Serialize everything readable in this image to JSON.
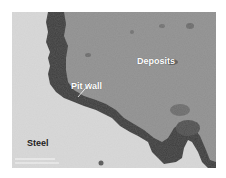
{
  "figure": {
    "type": "micrograph",
    "colors": {
      "steel": "#d9d9d9",
      "deposits": "#8f8f8f",
      "pit_wall_dark": "#3c3c3c",
      "label_light": "#ffffff",
      "label_dark": "#1e1e1e"
    },
    "labels": {
      "deposits": "Deposits",
      "pit_wall": "Pit wall",
      "steel": "Steel"
    }
  }
}
